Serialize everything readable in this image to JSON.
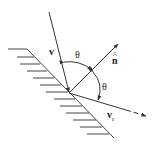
{
  "figure": {
    "labels": {
      "incident_velocity": "v",
      "normal": "n",
      "normal_hat": "^",
      "reflected_velocity": "v",
      "reflected_subscript": "r",
      "angle_incident": "θ",
      "angle_reflected": "θ"
    },
    "colors": {
      "stroke": "#333333",
      "background": "#ffffff"
    }
  }
}
